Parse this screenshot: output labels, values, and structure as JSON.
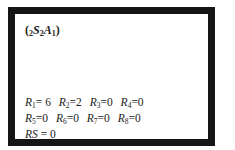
{
  "title": {
    "prefix_sub": "2",
    "s_letter": "S",
    "s_sub": "2",
    "a_letter": "A",
    "a_sub": "1"
  },
  "stats": {
    "rows": [
      [
        {
          "letter": "R",
          "sub": "1",
          "value": "= 6"
        },
        {
          "letter": "R",
          "sub": "2",
          "value": "=2"
        },
        {
          "letter": "R",
          "sub": "3",
          "value": "=0"
        },
        {
          "letter": "R",
          "sub": "4",
          "value": "=0"
        }
      ],
      [
        {
          "letter": "R",
          "sub": "5",
          "value": "=0"
        },
        {
          "letter": "R",
          "sub": "6",
          "value": "=0"
        },
        {
          "letter": "R",
          "sub": "7",
          "value": "=0"
        },
        {
          "letter": "R",
          "sub": "8",
          "value": "=0"
        }
      ]
    ],
    "rs_label": "RS",
    "rs_value": " = 0"
  }
}
